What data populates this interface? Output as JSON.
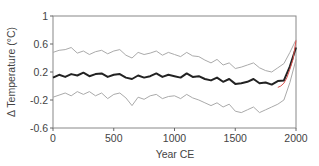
{
  "chart_data": {
    "type": "line",
    "title": "",
    "xlabel": "Year CE",
    "ylabel": "Δ Temperature (°C)",
    "xlim": [
      0,
      2000
    ],
    "ylim": [
      -0.6,
      1
    ],
    "xticks": [
      0,
      500,
      1000,
      1500,
      2000
    ],
    "yticks": [
      1,
      0.6,
      0.2,
      -0.2,
      -0.6
    ],
    "ytick_labels": [
      "1",
      "0.6",
      "0.2",
      "-0.2",
      "-0.6"
    ],
    "xtick_labels": [
      "0",
      "500",
      "1000",
      "1500",
      "2000"
    ],
    "grid": false,
    "legend": null,
    "x": [
      0,
      50,
      100,
      150,
      200,
      250,
      300,
      350,
      400,
      450,
      500,
      550,
      600,
      650,
      700,
      750,
      800,
      850,
      900,
      950,
      1000,
      1050,
      1100,
      1150,
      1200,
      1250,
      1300,
      1350,
      1400,
      1450,
      1500,
      1550,
      1600,
      1650,
      1700,
      1750,
      1800,
      1850,
      1900,
      1950,
      2000
    ],
    "series": [
      {
        "name": "Reconstruction (mean)",
        "color": "#222222",
        "values": [
          0.12,
          0.16,
          0.13,
          0.17,
          0.15,
          0.19,
          0.14,
          0.17,
          0.18,
          0.13,
          0.16,
          0.17,
          0.12,
          0.1,
          0.15,
          0.12,
          0.14,
          0.18,
          0.13,
          0.16,
          0.14,
          0.12,
          0.18,
          0.13,
          0.14,
          0.1,
          0.08,
          0.12,
          0.06,
          0.1,
          0.03,
          0.04,
          0.06,
          0.1,
          0.04,
          0.05,
          0.02,
          0.07,
          0.08,
          0.28,
          0.55
        ]
      },
      {
        "name": "Upper uncertainty",
        "color": "#aaaaaa",
        "values": [
          0.48,
          0.51,
          0.52,
          0.55,
          0.47,
          0.5,
          0.45,
          0.49,
          0.51,
          0.46,
          0.5,
          0.52,
          0.44,
          0.4,
          0.48,
          0.45,
          0.47,
          0.5,
          0.44,
          0.48,
          0.45,
          0.42,
          0.48,
          0.43,
          0.42,
          0.37,
          0.33,
          0.38,
          0.3,
          0.33,
          0.25,
          0.27,
          0.3,
          0.33,
          0.26,
          0.22,
          0.2,
          0.26,
          0.32,
          0.48,
          0.66
        ]
      },
      {
        "name": "Lower uncertainty",
        "color": "#aaaaaa",
        "values": [
          -0.16,
          -0.13,
          -0.1,
          -0.14,
          -0.08,
          -0.12,
          -0.08,
          -0.14,
          -0.1,
          -0.18,
          -0.12,
          -0.1,
          -0.17,
          -0.28,
          -0.16,
          -0.19,
          -0.14,
          -0.12,
          -0.18,
          -0.15,
          -0.14,
          -0.18,
          -0.12,
          -0.17,
          -0.2,
          -0.24,
          -0.28,
          -0.24,
          -0.3,
          -0.26,
          -0.36,
          -0.38,
          -0.34,
          -0.3,
          -0.38,
          -0.34,
          -0.3,
          -0.26,
          -0.2,
          0.05,
          0.38
        ]
      },
      {
        "name": "Instrumental",
        "color": "#d9534f",
        "x": [
          1850,
          1875,
          1900,
          1925,
          1950,
          1975,
          2000
        ],
        "values": [
          -0.02,
          0.0,
          0.04,
          0.12,
          0.24,
          0.38,
          0.65
        ]
      }
    ]
  }
}
